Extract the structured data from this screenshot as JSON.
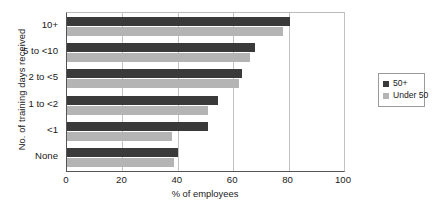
{
  "chart_data": {
    "type": "bar",
    "orientation": "horizontal",
    "title": "",
    "xlabel": "% of employees",
    "ylabel": "No. of training days received",
    "xlim": [
      0,
      100
    ],
    "xticks": [
      0,
      20,
      40,
      60,
      80,
      100
    ],
    "grid": true,
    "grid_axis": "x",
    "legend_position": "right",
    "categories": [
      "10+",
      "5 to <10",
      "2 to <5",
      "1 to <2",
      "<1",
      "None"
    ],
    "series": [
      {
        "name": "50+",
        "color": "#3a3a3a",
        "values": [
          80.5,
          68,
          63,
          54.5,
          51,
          40
        ]
      },
      {
        "name": "Under 50",
        "color": "#b4b4b4",
        "values": [
          78,
          66,
          62,
          51,
          38,
          38.5
        ]
      }
    ]
  },
  "legend": {
    "items": [
      {
        "label": "50+"
      },
      {
        "label": "Under 50"
      }
    ]
  },
  "caption": {
    "text": ""
  }
}
